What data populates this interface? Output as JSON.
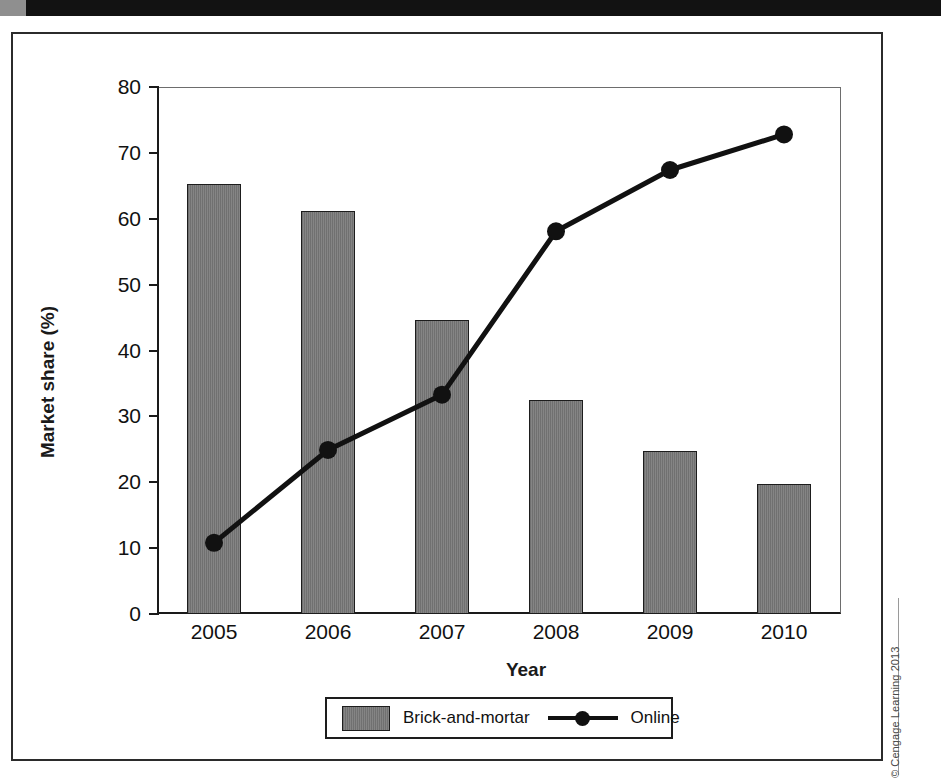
{
  "page": {
    "credit": "© Cengage Learning 2013"
  },
  "chart_data": {
    "type": "bar",
    "title": "",
    "subtitle": "",
    "xlabel": "Year",
    "ylabel": "Market share (%)",
    "categories": [
      "2005",
      "2006",
      "2007",
      "2008",
      "2009",
      "2010"
    ],
    "ylim": [
      0,
      80
    ],
    "y_ticks": [
      0,
      10,
      20,
      30,
      40,
      50,
      60,
      70,
      80
    ],
    "grid": false,
    "legend_position": "bottom",
    "series": [
      {
        "name": "Brick-and-mortar",
        "type": "bar",
        "color": "#7e7e7e",
        "values": [
          65.2,
          61.2,
          44.7,
          32.5,
          24.7,
          19.7
        ]
      },
      {
        "name": "Online",
        "type": "line",
        "color": "#111111",
        "values": [
          10.8,
          24.9,
          33.3,
          58.1,
          67.4,
          72.8
        ]
      }
    ]
  },
  "legend": {
    "bar_label": "Brick-and-mortar",
    "line_label": "Online"
  }
}
